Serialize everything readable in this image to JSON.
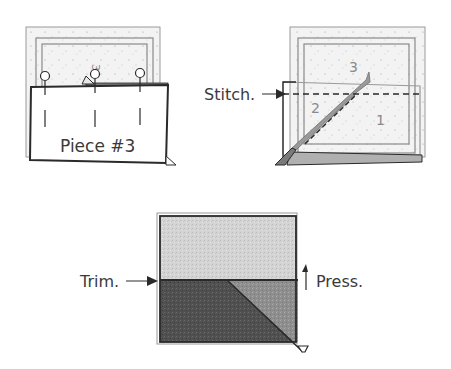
{
  "colors": {
    "background": "#ffffff",
    "line_dark": "#2a2a2a",
    "line_mid": "#6e6e6e",
    "line_light": "#9a9a9a",
    "paper": "#f1f1f1",
    "fabric_light": "#d6d6d6",
    "fabric_medium": "#8c8c8c",
    "fabric_dark": "#4e4e4e"
  },
  "figures": [
    {
      "id": "step-place-piece",
      "label": "Piece #3",
      "section_number": "3",
      "pins": 3
    },
    {
      "id": "step-stitch",
      "callout": "Stitch.",
      "section_numbers": [
        "1",
        "2",
        "3"
      ]
    },
    {
      "id": "step-trim-press",
      "callouts": {
        "left": "Trim.",
        "right": "Press."
      }
    }
  ]
}
